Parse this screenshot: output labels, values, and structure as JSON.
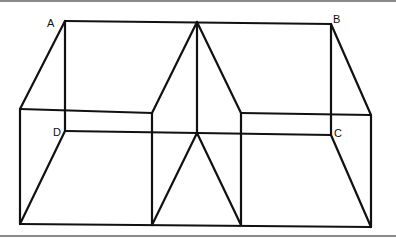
{
  "figure": {
    "labels": {
      "a": "A",
      "b": "B",
      "c": "C",
      "d": "D"
    },
    "line_color": "#111111",
    "rule_color": "#8a8a8a",
    "background": "#ffffff"
  }
}
